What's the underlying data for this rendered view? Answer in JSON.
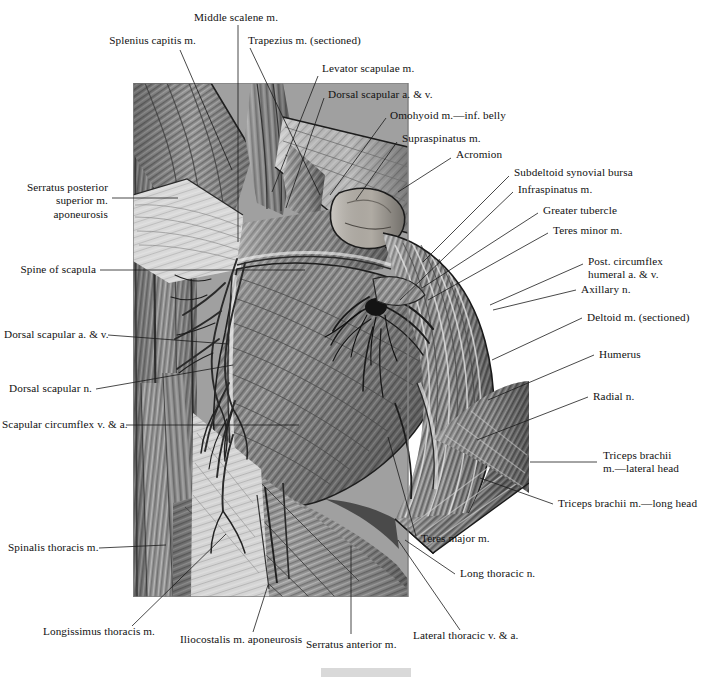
{
  "plate": {
    "title": "Posterior shoulder and scapular region dissection",
    "illustration_style": "grayscale anatomical drawing",
    "footer_bar_color": "#d9d9d9",
    "background_color": "#ffffff",
    "text_color": "#111111",
    "leader_line_color": "#1b1b1b"
  },
  "labels": [
    {
      "id": "splenius-capitis",
      "text": "Splenius capitis m."
    },
    {
      "id": "middle-scalene",
      "text": "Middle scalene m."
    },
    {
      "id": "trapezius-sectioned",
      "text": "Trapezius m. (sectioned)"
    },
    {
      "id": "levator-scapulae",
      "text": "Levator scapulae m."
    },
    {
      "id": "dorsal-scapular-av-top",
      "text": "Dorsal scapular a. & v."
    },
    {
      "id": "omohyoid-inf-belly",
      "text": "Omohyoid m.—inf. belly"
    },
    {
      "id": "supraspinatus",
      "text": "Supraspinatus m."
    },
    {
      "id": "acromion",
      "text": "Acromion"
    },
    {
      "id": "subdeltoid-synovial-bursa",
      "text": "Subdeltoid synovial bursa"
    },
    {
      "id": "infraspinatus",
      "text": "Infraspinatus m."
    },
    {
      "id": "greater-tubercle",
      "text": "Greater tubercle"
    },
    {
      "id": "teres-minor",
      "text": "Teres minor m."
    },
    {
      "id": "post-circumflex-humeral",
      "text": "Post. circumflex\nhumeral a. & v."
    },
    {
      "id": "axillary-n",
      "text": "Axillary n."
    },
    {
      "id": "deltoid-sectioned",
      "text": "Deltoid m. (sectioned)"
    },
    {
      "id": "humerus",
      "text": "Humerus"
    },
    {
      "id": "radial-n",
      "text": "Radial n."
    },
    {
      "id": "triceps-lateral-head",
      "text": "Triceps brachii\nm.—lateral head"
    },
    {
      "id": "triceps-long-head",
      "text": "Triceps brachii m.—long head"
    },
    {
      "id": "serratus-posterior-superior",
      "text": "Serratus posterior\nsuperior m.\naponeurosis"
    },
    {
      "id": "spine-of-scapula",
      "text": "Spine of scapula"
    },
    {
      "id": "dorsal-scapular-av-left",
      "text": "Dorsal scapular a. & v."
    },
    {
      "id": "dorsal-scapular-n",
      "text": "Dorsal scapular n."
    },
    {
      "id": "scapular-circumflex",
      "text": "Scapular circumflex v. & a."
    },
    {
      "id": "spinalis-thoracis",
      "text": "Spinalis thoracis m."
    },
    {
      "id": "longissimus-thoracis",
      "text": "Longissimus thoracis m."
    },
    {
      "id": "iliocostalis-aponeurosis",
      "text": "Iliocostalis m. aponeurosis"
    },
    {
      "id": "serratus-anterior",
      "text": "Serratus anterior m."
    },
    {
      "id": "teres-major",
      "text": "Teres major m."
    },
    {
      "id": "long-thoracic-n",
      "text": "Long thoracic n."
    },
    {
      "id": "lateral-thoracic",
      "text": "Lateral thoracic v. & a."
    }
  ]
}
